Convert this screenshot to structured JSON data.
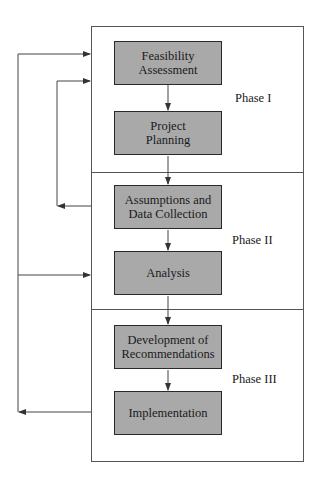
{
  "diagram": {
    "steps": [
      {
        "label": "Feasibility\nAssessment",
        "phase": 1
      },
      {
        "label": "Project\nPlanning",
        "phase": 1
      },
      {
        "label": "Assumptions and\nData Collection",
        "phase": 2
      },
      {
        "label": "Analysis",
        "phase": 2
      },
      {
        "label": "Development of\nRecommendations",
        "phase": 3
      },
      {
        "label": "Implementation",
        "phase": 3
      }
    ],
    "phases": [
      {
        "label": "Phase I"
      },
      {
        "label": "Phase II"
      },
      {
        "label": "Phase III"
      }
    ],
    "colors": {
      "box_fill": "#a9a9a9",
      "box_border": "#2a2a2a",
      "line": "#444444"
    }
  }
}
